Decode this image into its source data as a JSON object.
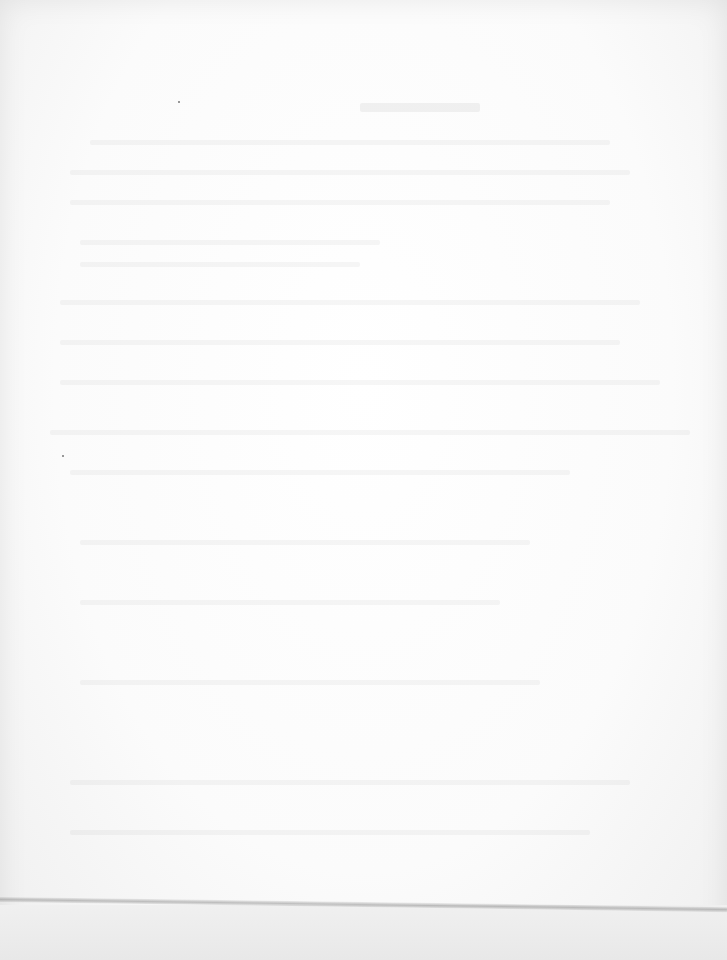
{
  "document": {
    "type": "scanned page",
    "legibility": "text too faded to read",
    "title": "",
    "body_lines": []
  },
  "colors": {
    "paper": "#fbfbfb",
    "fold_line": "#8c8c8c"
  }
}
